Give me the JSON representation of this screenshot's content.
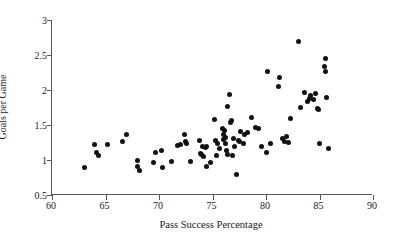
{
  "chart_data": {
    "type": "scatter",
    "title": "",
    "xlabel": "Pass Success Percentage",
    "ylabel": "Goals per Game",
    "xlim": [
      60,
      90
    ],
    "ylim": [
      0.5,
      3
    ],
    "xticks": [
      60,
      65,
      70,
      75,
      80,
      85,
      90
    ],
    "xtick_labels": [
      "60",
      "65",
      "70",
      "75",
      "80",
      "85",
      "90"
    ],
    "yticks": [
      0.5,
      1,
      1.5,
      2,
      2.5,
      3
    ],
    "ytick_labels": [
      "0.5",
      "1",
      "1.5",
      "2",
      "2.5",
      "3"
    ],
    "grid": false,
    "legend": null,
    "marker": {
      "shape": "circle",
      "color": "#111111",
      "size_px": 5
    },
    "axis_color": "#555555",
    "background_color": "#ffffff",
    "n_points": 96,
    "points": [
      {
        "x": 63.0,
        "y": 0.9
      },
      {
        "x": 64.0,
        "y": 1.22
      },
      {
        "x": 64.2,
        "y": 1.11
      },
      {
        "x": 64.3,
        "y": 1.07
      },
      {
        "x": 65.2,
        "y": 1.22
      },
      {
        "x": 66.6,
        "y": 1.27
      },
      {
        "x": 67.0,
        "y": 1.37
      },
      {
        "x": 68.0,
        "y": 1.0
      },
      {
        "x": 68.0,
        "y": 0.91
      },
      {
        "x": 68.2,
        "y": 0.85
      },
      {
        "x": 69.5,
        "y": 0.96
      },
      {
        "x": 69.7,
        "y": 1.11
      },
      {
        "x": 70.2,
        "y": 1.13
      },
      {
        "x": 70.3,
        "y": 0.9
      },
      {
        "x": 71.2,
        "y": 0.98
      },
      {
        "x": 71.7,
        "y": 1.21
      },
      {
        "x": 72.0,
        "y": 1.22
      },
      {
        "x": 72.4,
        "y": 1.37
      },
      {
        "x": 72.5,
        "y": 1.26
      },
      {
        "x": 72.6,
        "y": 1.24
      },
      {
        "x": 72.9,
        "y": 0.98
      },
      {
        "x": 73.8,
        "y": 1.28
      },
      {
        "x": 73.9,
        "y": 1.1
      },
      {
        "x": 74.0,
        "y": 1.08
      },
      {
        "x": 74.1,
        "y": 1.2
      },
      {
        "x": 74.2,
        "y": 1.05
      },
      {
        "x": 74.3,
        "y": 1.18
      },
      {
        "x": 74.4,
        "y": 1.19
      },
      {
        "x": 74.4,
        "y": 0.91
      },
      {
        "x": 74.8,
        "y": 0.97
      },
      {
        "x": 75.2,
        "y": 1.58
      },
      {
        "x": 75.3,
        "y": 1.28
      },
      {
        "x": 75.4,
        "y": 1.06
      },
      {
        "x": 75.5,
        "y": 1.24
      },
      {
        "x": 75.7,
        "y": 1.16
      },
      {
        "x": 75.9,
        "y": 1.45
      },
      {
        "x": 76.0,
        "y": 1.36
      },
      {
        "x": 76.0,
        "y": 1.3
      },
      {
        "x": 76.1,
        "y": 1.42
      },
      {
        "x": 76.2,
        "y": 1.32
      },
      {
        "x": 76.2,
        "y": 1.24
      },
      {
        "x": 76.3,
        "y": 1.13
      },
      {
        "x": 76.4,
        "y": 1.76
      },
      {
        "x": 76.4,
        "y": 1.08
      },
      {
        "x": 76.6,
        "y": 1.93
      },
      {
        "x": 76.7,
        "y": 1.53
      },
      {
        "x": 76.8,
        "y": 1.56
      },
      {
        "x": 76.9,
        "y": 1.07
      },
      {
        "x": 77.0,
        "y": 1.31
      },
      {
        "x": 77.1,
        "y": 1.2
      },
      {
        "x": 77.2,
        "y": 0.79
      },
      {
        "x": 77.4,
        "y": 1.28
      },
      {
        "x": 77.5,
        "y": 1.26
      },
      {
        "x": 77.6,
        "y": 1.41
      },
      {
        "x": 77.9,
        "y": 1.23
      },
      {
        "x": 78.0,
        "y": 1.37
      },
      {
        "x": 78.3,
        "y": 1.4
      },
      {
        "x": 78.6,
        "y": 1.61
      },
      {
        "x": 79.0,
        "y": 1.46
      },
      {
        "x": 79.3,
        "y": 1.45
      },
      {
        "x": 79.6,
        "y": 1.19
      },
      {
        "x": 80.0,
        "y": 1.11
      },
      {
        "x": 80.1,
        "y": 2.26
      },
      {
        "x": 80.4,
        "y": 1.24
      },
      {
        "x": 81.2,
        "y": 2.05
      },
      {
        "x": 81.3,
        "y": 2.18
      },
      {
        "x": 81.5,
        "y": 1.31
      },
      {
        "x": 81.7,
        "y": 1.27
      },
      {
        "x": 81.9,
        "y": 1.34
      },
      {
        "x": 82.1,
        "y": 1.25
      },
      {
        "x": 82.3,
        "y": 1.59
      },
      {
        "x": 83.0,
        "y": 2.7
      },
      {
        "x": 83.2,
        "y": 1.75
      },
      {
        "x": 83.6,
        "y": 1.97
      },
      {
        "x": 83.9,
        "y": 1.84
      },
      {
        "x": 84.1,
        "y": 1.88
      },
      {
        "x": 84.2,
        "y": 1.92
      },
      {
        "x": 84.4,
        "y": 1.86
      },
      {
        "x": 84.6,
        "y": 1.95
      },
      {
        "x": 84.8,
        "y": 1.74
      },
      {
        "x": 84.9,
        "y": 1.72
      },
      {
        "x": 85.0,
        "y": 1.24
      },
      {
        "x": 85.5,
        "y": 2.34
      },
      {
        "x": 85.6,
        "y": 2.45
      },
      {
        "x": 85.6,
        "y": 2.26
      },
      {
        "x": 85.7,
        "y": 1.89
      },
      {
        "x": 85.8,
        "y": 1.16
      }
    ]
  }
}
